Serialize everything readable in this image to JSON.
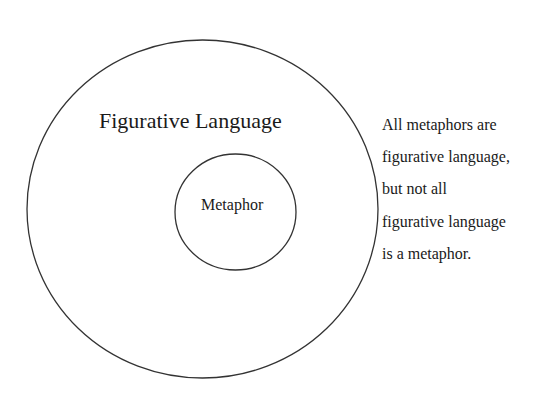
{
  "diagram": {
    "type": "nested-circles",
    "outer_set": {
      "label": "Figurative Language",
      "stroke": "#333333"
    },
    "inner_set": {
      "label": "Metaphor",
      "stroke": "#333333"
    },
    "annotation": {
      "lines": [
        "All metaphors are",
        "figurative language,",
        "but not all",
        "figurative language",
        "is a metaphor."
      ]
    }
  }
}
